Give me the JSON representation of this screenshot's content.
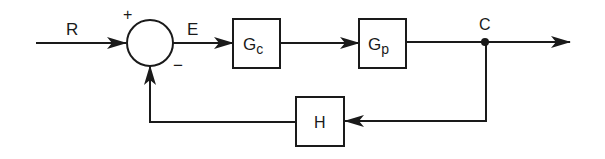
{
  "diagram": {
    "type": "feedback-control-block-diagram",
    "colors": {
      "stroke": "#1a1a1a",
      "background": "#ffffff"
    },
    "signals": {
      "reference": "R",
      "error": "E",
      "output": "C"
    },
    "summing_junction": {
      "plus_sign": "+",
      "minus_sign": "−"
    },
    "blocks": {
      "controller": {
        "main": "G",
        "sub": "c"
      },
      "plant": {
        "main": "G",
        "sub": "p"
      },
      "feedback": {
        "main": "H"
      }
    }
  }
}
